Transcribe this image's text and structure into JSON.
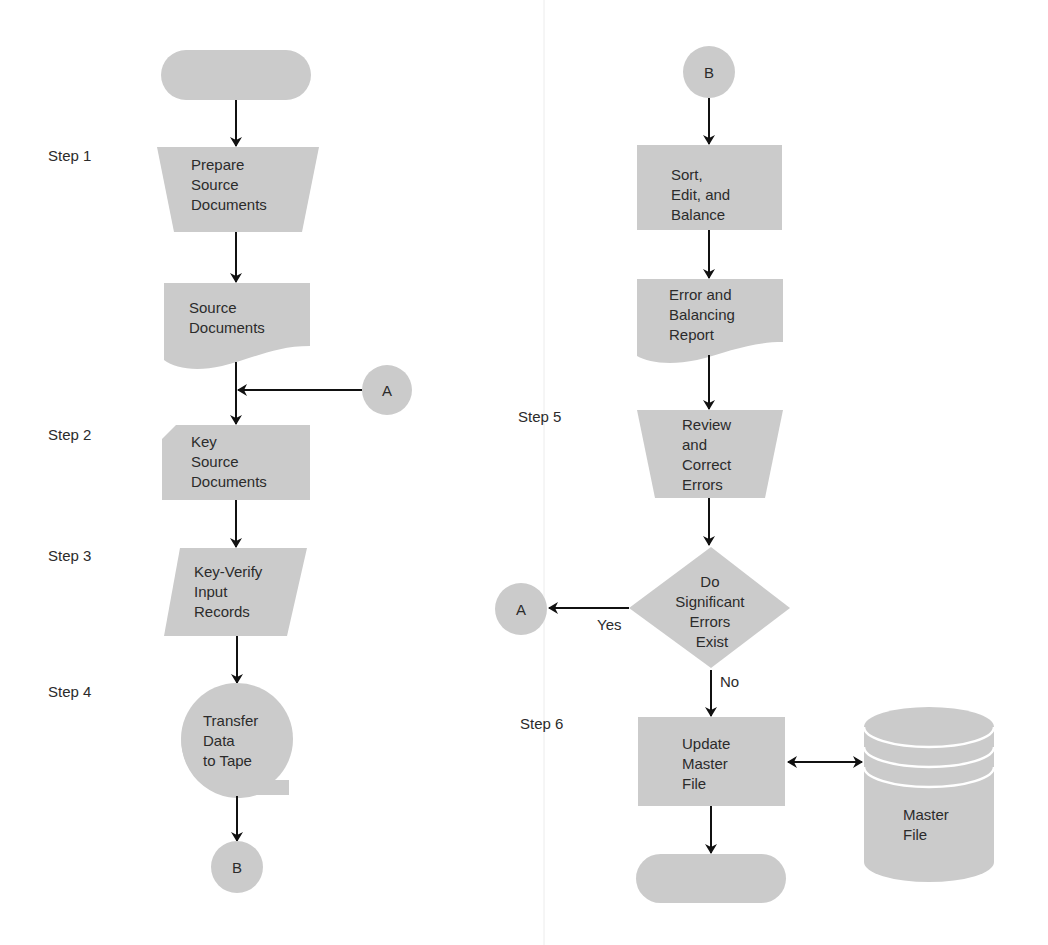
{
  "divider": true,
  "colors": {
    "shape_fill": "#cbcbcb",
    "line": "#111111",
    "text": "#2b2b2b",
    "background": "#ffffff"
  },
  "steps": {
    "step1": "Step 1",
    "step2": "Step 2",
    "step3": "Step 3",
    "step4": "Step 4",
    "step5": "Step 5",
    "step6": "Step 6"
  },
  "left_column": {
    "start_terminal": "",
    "prepare": [
      "Prepare",
      "Source",
      "Documents"
    ],
    "source_docs": [
      "Source",
      "Documents"
    ],
    "connector_a": "A",
    "key_source": [
      "Key",
      "Source",
      "Documents"
    ],
    "key_verify": [
      "Key-Verify",
      "Input",
      "Records"
    ],
    "transfer": [
      "Transfer",
      "Data",
      "to Tape"
    ],
    "connector_b": "B"
  },
  "right_column": {
    "connector_b": "B",
    "sort_edit": [
      "Sort,",
      "Edit, and",
      "Balance"
    ],
    "error_report": [
      "Error and",
      "Balancing",
      "Report"
    ],
    "review": [
      "Review",
      "and",
      "Correct",
      "Errors"
    ],
    "decision": [
      "Do",
      "Significant",
      "Errors",
      "Exist"
    ],
    "yes_label": "Yes",
    "no_label": "No",
    "connector_a": "A",
    "update_master": [
      "Update",
      "Master",
      "File"
    ],
    "master_file": [
      "Master",
      "File"
    ],
    "end_terminal": ""
  }
}
